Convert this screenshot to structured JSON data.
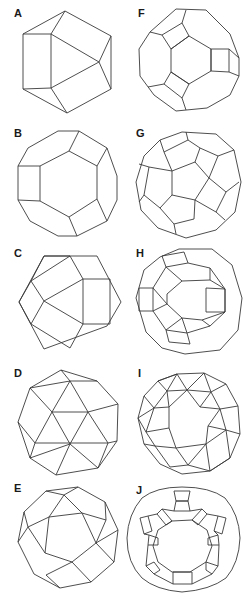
{
  "figure": {
    "panels": [
      {
        "label": "A",
        "shape": "polyhedron-A"
      },
      {
        "label": "B",
        "shape": "polyhedron-B"
      },
      {
        "label": "C",
        "shape": "polyhedron-C"
      },
      {
        "label": "D",
        "shape": "polyhedron-D"
      },
      {
        "label": "E",
        "shape": "polyhedron-E"
      },
      {
        "label": "F",
        "shape": "polyhedron-F"
      },
      {
        "label": "G",
        "shape": "polyhedron-G"
      },
      {
        "label": "H",
        "shape": "polyhedron-H"
      },
      {
        "label": "I",
        "shape": "polyhedron-I"
      },
      {
        "label": "J",
        "shape": "polyhedron-J"
      }
    ]
  }
}
